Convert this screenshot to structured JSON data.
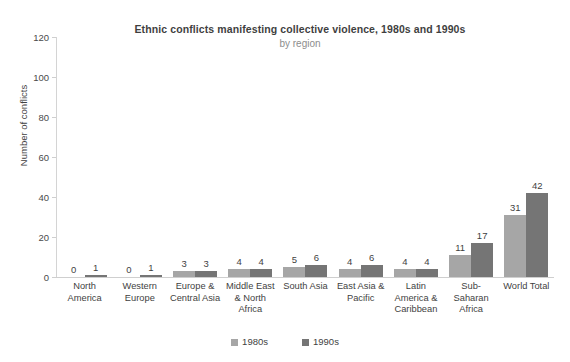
{
  "chart_data": {
    "type": "bar",
    "title": "Ethnic conflicts manifesting collective violence, 1980s and 1990s",
    "subtitle": "by region",
    "xlabel": "",
    "ylabel": "Number of conflicts",
    "ylim": [
      0,
      120
    ],
    "yticks": [
      0,
      20,
      40,
      60,
      80,
      100,
      120
    ],
    "grid": false,
    "legend_position": "bottom",
    "categories": [
      "North America",
      "Western Europe",
      "Europe & Central Asia",
      "Middle East & North Africa",
      "South Asia",
      "East Asia & Pacific",
      "Latin America & Caribbean",
      "Sub-Saharan Africa",
      "World Total"
    ],
    "series": [
      {
        "name": "1980s",
        "color": "#a6a6a6",
        "values": [
          0,
          0,
          3,
          4,
          5,
          4,
          4,
          11,
          31
        ]
      },
      {
        "name": "1990s",
        "color": "#757575",
        "values": [
          1,
          1,
          3,
          4,
          6,
          6,
          4,
          17,
          42
        ]
      }
    ]
  }
}
